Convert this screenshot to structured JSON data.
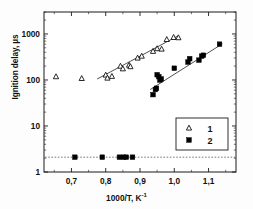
{
  "chart_data": {
    "type": "scatter",
    "title": "",
    "xlabel": "1000/T, K⁻¹",
    "ylabel": "Ignition delay, µs",
    "xlabel_base": "1000/T, K",
    "xlabel_sup": "-1",
    "x_scale": "linear",
    "y_scale": "log",
    "xlim": [
      0.62,
      1.18
    ],
    "ylim": [
      1,
      3000
    ],
    "xticks": [
      0.7,
      0.8,
      0.9,
      1.0,
      1.1
    ],
    "xticklabels": [
      "0,7",
      "0,8",
      "0,9",
      "1,0",
      "1,1"
    ],
    "yticks": [
      1,
      10,
      100,
      1000
    ],
    "yticklabels": [
      "1",
      "10",
      "100",
      "1000"
    ],
    "grid": false,
    "legend_position": "lower-right",
    "reference_line": {
      "name": "lower-limit-dotted-line",
      "y": 2.1,
      "style": "dotted",
      "color": "#555555"
    },
    "series": [
      {
        "name": "1",
        "label": "1",
        "marker": "open-triangle",
        "color": "#000000",
        "fill": "none",
        "points": [
          {
            "x": 0.655,
            "y": 118
          },
          {
            "x": 0.73,
            "y": 108
          },
          {
            "x": 0.8,
            "y": 128
          },
          {
            "x": 0.805,
            "y": 110
          },
          {
            "x": 0.818,
            "y": 120
          },
          {
            "x": 0.843,
            "y": 200
          },
          {
            "x": 0.85,
            "y": 175
          },
          {
            "x": 0.868,
            "y": 210
          },
          {
            "x": 0.872,
            "y": 195
          },
          {
            "x": 0.893,
            "y": 300
          },
          {
            "x": 0.905,
            "y": 330
          },
          {
            "x": 0.938,
            "y": 420
          },
          {
            "x": 0.95,
            "y": 480
          },
          {
            "x": 0.963,
            "y": 470
          },
          {
            "x": 0.978,
            "y": 760
          },
          {
            "x": 0.998,
            "y": 840
          },
          {
            "x": 1.012,
            "y": 830
          }
        ],
        "fit_line": {
          "x1": 0.775,
          "y1": 105,
          "x2": 1.01,
          "y2": 900
        }
      },
      {
        "name": "2",
        "label": "2",
        "marker": "filled-square",
        "color": "#000000",
        "fill": "#000000",
        "points": [
          {
            "x": 0.938,
            "y": 48
          },
          {
            "x": 0.945,
            "y": 62
          },
          {
            "x": 0.948,
            "y": 66
          },
          {
            "x": 0.95,
            "y": 130
          },
          {
            "x": 0.955,
            "y": 118
          },
          {
            "x": 0.958,
            "y": 100
          },
          {
            "x": 0.962,
            "y": 105
          },
          {
            "x": 1.0,
            "y": 180
          },
          {
            "x": 1.04,
            "y": 245
          },
          {
            "x": 1.045,
            "y": 290
          },
          {
            "x": 1.072,
            "y": 270
          },
          {
            "x": 1.08,
            "y": 330
          },
          {
            "x": 1.085,
            "y": 345
          },
          {
            "x": 1.132,
            "y": 600
          },
          {
            "x": 0.71,
            "y": 2.1
          },
          {
            "x": 0.79,
            "y": 2.1
          },
          {
            "x": 0.84,
            "y": 2.1
          },
          {
            "x": 0.852,
            "y": 2.1
          },
          {
            "x": 0.86,
            "y": 2.1
          },
          {
            "x": 0.878,
            "y": 2.1
          }
        ],
        "fit_line": {
          "x1": 0.93,
          "y1": 62,
          "x2": 1.14,
          "y2": 610
        }
      }
    ]
  }
}
